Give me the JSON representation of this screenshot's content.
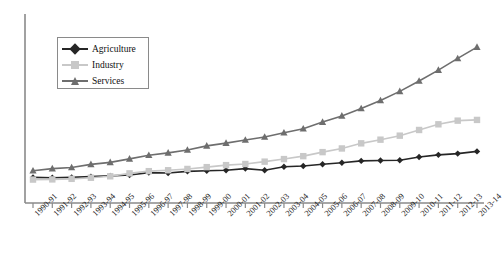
{
  "chart_data": {
    "type": "line",
    "title": "",
    "subtitle": "",
    "xlabel": "",
    "ylabel": "",
    "grid": false,
    "legend_position": "top-left",
    "categories": [
      "1990-91",
      "1991-92",
      "1992-93",
      "1993-94",
      "1994-95",
      "1995-96",
      "1996-97",
      "1997-98",
      "1998-99",
      "1999-00",
      "2000-01",
      "2001-02",
      "2002-03",
      "2003-04",
      "2004-05",
      "2005-06",
      "2006-07",
      "2007-08",
      "2008-09",
      "2009-10",
      "2010-11",
      "2011-12",
      "2012-13",
      "2013-14"
    ],
    "xlim": [
      0,
      23
    ],
    "ylim": [
      0,
      100
    ],
    "series": [
      {
        "name": "Agriculture",
        "color": "#262626",
        "marker": "diamond",
        "values": [
          14.0,
          13.8,
          14.0,
          14.4,
          14.8,
          15.3,
          16.6,
          16.4,
          17.3,
          17.6,
          17.9,
          18.8,
          17.9,
          19.8,
          20.2,
          21.2,
          22.0,
          23.0,
          23.2,
          23.4,
          25.1,
          26.3,
          27.0,
          28.2
        ]
      },
      {
        "name": "Industry",
        "color": "#c8c8c8",
        "marker": "square",
        "values": [
          12.8,
          12.9,
          13.2,
          13.8,
          14.6,
          16.2,
          17.4,
          17.9,
          18.6,
          19.6,
          20.7,
          21.3,
          22.6,
          24.0,
          25.6,
          27.8,
          29.8,
          32.6,
          34.6,
          36.8,
          39.9,
          43.0,
          45.0,
          45.4
        ]
      },
      {
        "name": "Services",
        "color": "#6e6e6e",
        "marker": "triangle",
        "values": [
          17.6,
          18.8,
          19.4,
          21.1,
          22.2,
          24.1,
          26.1,
          27.4,
          29.0,
          31.2,
          32.7,
          34.4,
          36.1,
          38.4,
          40.6,
          44.2,
          47.6,
          51.6,
          56.0,
          61.0,
          66.7,
          72.6,
          79.0,
          85.2
        ]
      }
    ]
  },
  "legend": {
    "items": [
      {
        "label": "Agriculture"
      },
      {
        "label": "Industry"
      },
      {
        "label": "Services"
      }
    ]
  },
  "axes": {
    "axis_color": "#8a8a8a",
    "tick_color": "#8a8a8a"
  }
}
